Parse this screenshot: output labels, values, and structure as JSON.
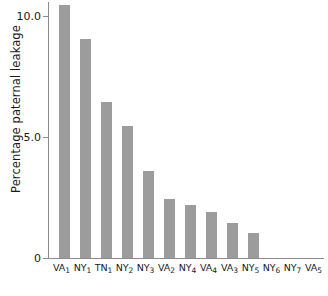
{
  "chart_data": {
    "type": "bar",
    "title": "",
    "xlabel": "",
    "ylabel": "Percentage paternal leakage",
    "ylim": [
      0,
      10.6
    ],
    "grid": false,
    "legend": null,
    "bar_color": "#9c9c9c",
    "axis_color": "#8c8c8c",
    "text_color": "#1a1a1a",
    "ytick_labels": [
      "10.0",
      "5.0",
      "0"
    ],
    "ytick_values": [
      10.0,
      5.0,
      0
    ],
    "categories": [
      "VA1",
      "NY1",
      "TN1",
      "NY2",
      "NY3",
      "VA2",
      "NY4",
      "VA4",
      "VA3",
      "NY5",
      "NY6",
      "NY7",
      "VA5"
    ],
    "category_labels": [
      {
        "base": "VA",
        "sub": "1"
      },
      {
        "base": "NY",
        "sub": "1"
      },
      {
        "base": "TN",
        "sub": "1"
      },
      {
        "base": "NY",
        "sub": "2"
      },
      {
        "base": "NY",
        "sub": "3"
      },
      {
        "base": "VA",
        "sub": "2"
      },
      {
        "base": "NY",
        "sub": "4"
      },
      {
        "base": "VA",
        "sub": "4"
      },
      {
        "base": "VA",
        "sub": "3"
      },
      {
        "base": "NY",
        "sub": "5"
      },
      {
        "base": "NY",
        "sub": "6"
      },
      {
        "base": "NY",
        "sub": "7"
      },
      {
        "base": "VA",
        "sub": "5"
      }
    ],
    "values": [
      10.45,
      9.05,
      6.45,
      5.45,
      3.6,
      2.45,
      2.2,
      1.9,
      1.45,
      1.05,
      0,
      0,
      0
    ]
  }
}
